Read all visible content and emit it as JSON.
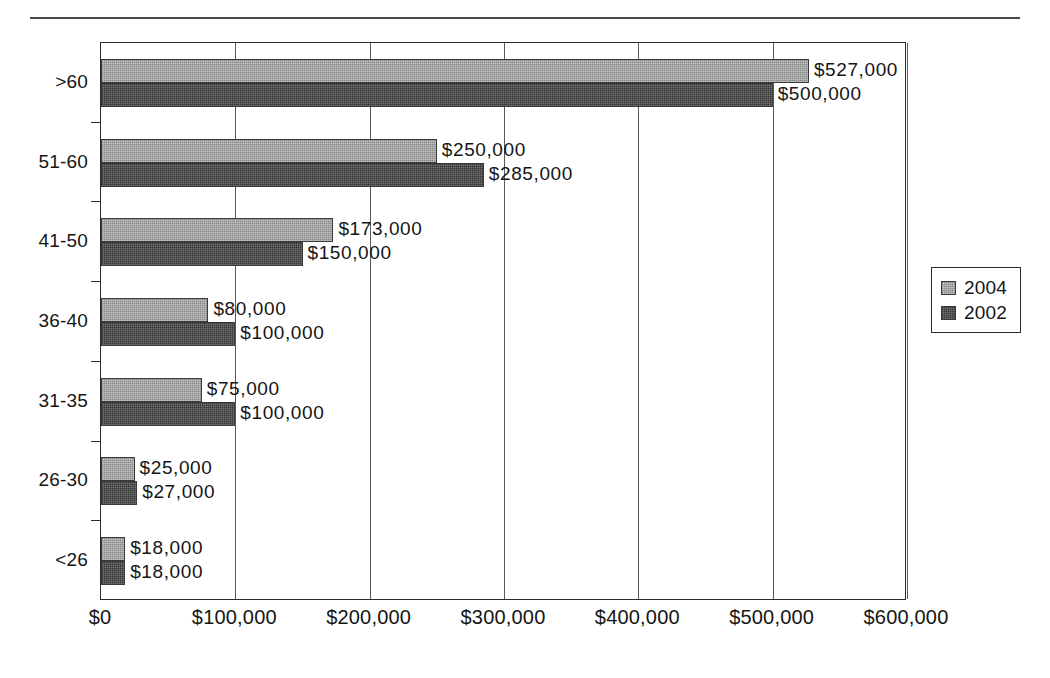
{
  "page": {
    "title_remnant": "",
    "rule": "horizontal-rule"
  },
  "legend": {
    "position": "right",
    "items": [
      {
        "label": "2004",
        "color": "#9b9b9b",
        "swatch": "legend-swatch-2004"
      },
      {
        "label": "2002",
        "color": "#474747",
        "swatch": "legend-swatch-2002"
      }
    ]
  },
  "axis": {
    "x_ticks": [
      "$0",
      "$100,000",
      "$200,000",
      "$300,000",
      "$400,000",
      "$500,000",
      "$600,000"
    ],
    "y_categories": [
      ">60",
      "51-60",
      "41-50",
      "36-40",
      "31-35",
      "26-30",
      "<26"
    ]
  },
  "chart_data": {
    "type": "bar",
    "orientation": "horizontal",
    "title": "",
    "subtitle": "",
    "xlabel": "",
    "ylabel": "",
    "xlim": [
      0,
      600000
    ],
    "xtick_values": [
      0,
      100000,
      200000,
      300000,
      400000,
      500000,
      600000
    ],
    "xtick_labels": [
      "$0",
      "$100,000",
      "$200,000",
      "$300,000",
      "$400,000",
      "$500,000",
      "$600,000"
    ],
    "grid": "vertical",
    "legend_position": "right",
    "categories": [
      ">60",
      "51-60",
      "41-50",
      "36-40",
      "31-35",
      "26-30",
      "<26"
    ],
    "series": [
      {
        "name": "2004",
        "color": "#9b9b9b",
        "values": [
          527000,
          250000,
          173000,
          80000,
          75000,
          25000,
          18000
        ],
        "data_labels": [
          "$527,000",
          "$250,000",
          "$173,000",
          "$80,000",
          "$75,000",
          "$25,000",
          "$18,000"
        ]
      },
      {
        "name": "2002",
        "color": "#474747",
        "values": [
          500000,
          285000,
          150000,
          100000,
          100000,
          27000,
          18000
        ],
        "data_labels": [
          "$500,000",
          "$285,000",
          "$150,000",
          "$100,000",
          "$100,000",
          "$27,000",
          "$18,000"
        ]
      }
    ]
  }
}
